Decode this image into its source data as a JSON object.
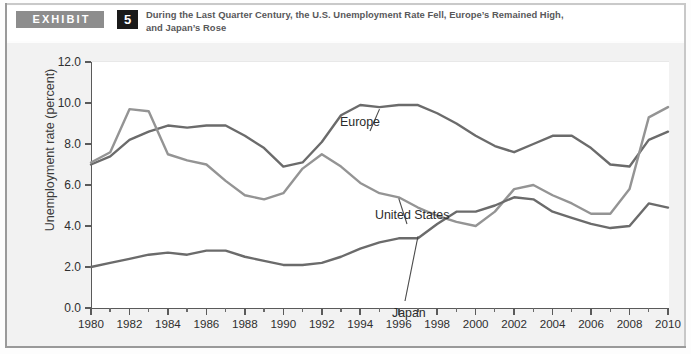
{
  "exhibit": {
    "tag_label": "EXHIBIT",
    "number": "5",
    "title_line1": "During the Last Quarter Century, the U.S. Unemployment Rate Fell, Europe’s Remained High,",
    "title_line2": "and Japan’s Rose"
  },
  "chart_data": {
    "type": "line",
    "title": "During the Last Quarter Century, the U.S. Unemployment Rate Fell, Europe’s Remained High, and Japan’s Rose",
    "xlabel": "",
    "ylabel": "Unemployment rate (percent)",
    "ylim": [
      0.0,
      12.0
    ],
    "xlim": [
      1980,
      2010
    ],
    "yticks": [
      "0.0",
      "2.0",
      "4.0",
      "6.0",
      "8.0",
      "10.0",
      "12.0"
    ],
    "ytick_values": [
      0.0,
      2.0,
      4.0,
      6.0,
      8.0,
      10.0,
      12.0
    ],
    "xticks": [
      "1980",
      "1982",
      "1984",
      "1986",
      "1988",
      "1990",
      "1992",
      "1994",
      "1996",
      "1998",
      "2000",
      "2002",
      "2004",
      "2006",
      "2008",
      "2010"
    ],
    "xtick_values": [
      1980,
      1982,
      1984,
      1986,
      1988,
      1990,
      1992,
      1994,
      1996,
      1998,
      2000,
      2002,
      2004,
      2006,
      2008,
      2010
    ],
    "grid": false,
    "legend_position": "inline-annotations",
    "x": [
      1980,
      1981,
      1982,
      1983,
      1984,
      1985,
      1986,
      1987,
      1988,
      1989,
      1990,
      1991,
      1992,
      1993,
      1994,
      1995,
      1996,
      1997,
      1998,
      1999,
      2000,
      2001,
      2002,
      2003,
      2004,
      2005,
      2006,
      2007,
      2008,
      2009,
      2010
    ],
    "series": [
      {
        "name": "Europe",
        "color": "#6b6b6b",
        "values": [
          7.0,
          7.4,
          8.2,
          8.6,
          8.9,
          8.8,
          8.9,
          8.9,
          8.4,
          7.8,
          6.9,
          7.1,
          8.1,
          9.4,
          9.9,
          9.8,
          9.9,
          9.9,
          9.5,
          9.0,
          8.4,
          7.9,
          7.6,
          8.0,
          8.4,
          8.4,
          7.8,
          7.0,
          6.9,
          8.2,
          8.6
        ]
      },
      {
        "name": "United States",
        "color": "#949494",
        "values": [
          7.1,
          7.6,
          9.7,
          9.6,
          7.5,
          7.2,
          7.0,
          6.2,
          5.5,
          5.3,
          5.6,
          6.8,
          7.5,
          6.9,
          6.1,
          5.6,
          5.4,
          4.9,
          4.5,
          4.2,
          4.0,
          4.7,
          5.8,
          6.0,
          5.5,
          5.1,
          4.6,
          4.6,
          5.8,
          9.3,
          9.8
        ]
      },
      {
        "name": "Japan",
        "color": "#6b6b6b",
        "values": [
          2.0,
          2.2,
          2.4,
          2.6,
          2.7,
          2.6,
          2.8,
          2.8,
          2.5,
          2.3,
          2.1,
          2.1,
          2.2,
          2.5,
          2.9,
          3.2,
          3.4,
          3.4,
          4.1,
          4.7,
          4.7,
          5.0,
          5.4,
          5.3,
          4.7,
          4.4,
          4.1,
          3.9,
          4.0,
          5.1,
          4.9
        ]
      }
    ],
    "annotations": [
      {
        "text": "Europe",
        "series": "Europe"
      },
      {
        "text": "United States",
        "series": "United States"
      },
      {
        "text": "Japan",
        "series": "Japan"
      }
    ]
  }
}
